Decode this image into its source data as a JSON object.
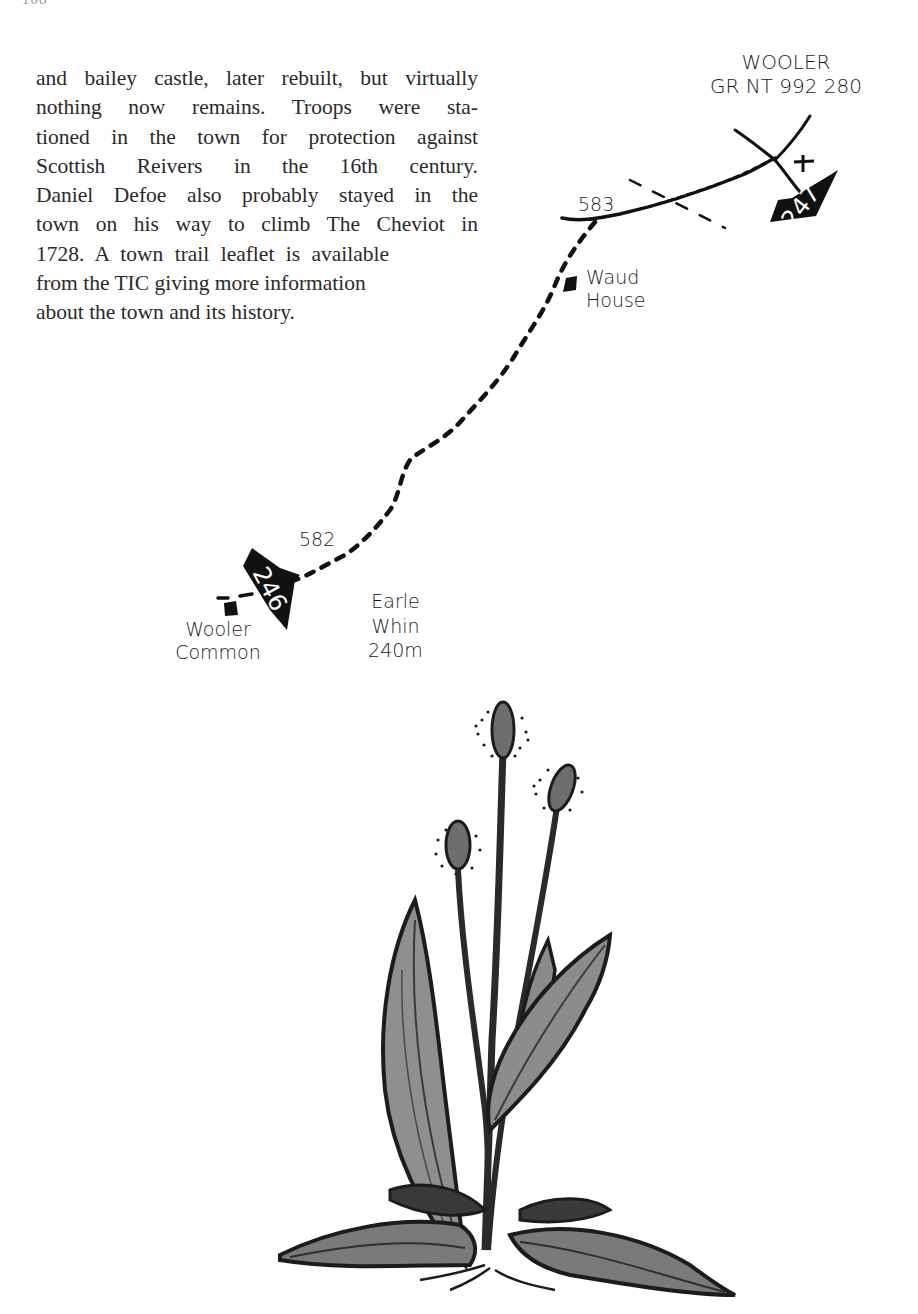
{
  "page": {
    "number": "108"
  },
  "text": {
    "lines": [
      "and bailey castle, later rebuilt, but virtually",
      "nothing now remains.  Troops were sta-",
      "tioned in the town for protection against",
      "Scottish Reivers in the 16th century.",
      "Daniel Defoe also probably stayed in the",
      "town on his way to climb The Cheviot in",
      "1728.  A town trail leaflet is available",
      "from the TIC giving more information",
      "about the town and its history."
    ]
  },
  "map": {
    "destination": {
      "name": "WOOLER",
      "grid_ref": "GR NT 992 280"
    },
    "waypoints": [
      {
        "number": "247",
        "label": "waypoint-247"
      },
      {
        "number": "246",
        "label": "waypoint-246"
      }
    ],
    "spot_heights": {
      "upper": "583",
      "lower": "582"
    },
    "places": {
      "waud_house": [
        "Waud",
        "House"
      ],
      "wooler_common": [
        "Wooler",
        "Common"
      ],
      "earle_whin": [
        "Earle",
        "Whin",
        "240m"
      ]
    },
    "symbols": {
      "church": "+",
      "route": "dashed-footpath"
    }
  },
  "illustration": {
    "subject": "plant-sketch",
    "flower_heads": 3,
    "colors": {
      "ink": "#1c1c1c",
      "shade": "#6e6e6e",
      "light_shade": "#9b9b9b"
    }
  }
}
